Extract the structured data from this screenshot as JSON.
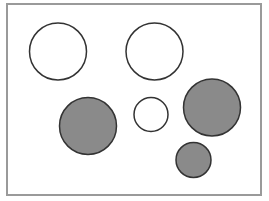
{
  "diagram": {
    "frame": {
      "x": 6,
      "y": 3,
      "width": 256,
      "height": 193,
      "border_color": "#9a9a9a"
    },
    "stroke_color": "#333333",
    "fill_colors": {
      "white": "#ffffff",
      "gray": "#8a8a8a"
    },
    "circles": [
      {
        "id": "circle-1",
        "cx": 58,
        "cy": 51.5,
        "r": 28.5,
        "fill": "white"
      },
      {
        "id": "circle-2",
        "cx": 154.5,
        "cy": 51.5,
        "r": 28.5,
        "fill": "white"
      },
      {
        "id": "circle-3",
        "cx": 88,
        "cy": 126,
        "r": 28.5,
        "fill": "gray"
      },
      {
        "id": "circle-4",
        "cx": 151,
        "cy": 114.5,
        "r": 17,
        "fill": "white"
      },
      {
        "id": "circle-5",
        "cx": 212,
        "cy": 107.5,
        "r": 28.5,
        "fill": "gray"
      },
      {
        "id": "circle-6",
        "cx": 193.5,
        "cy": 160,
        "r": 17.5,
        "fill": "gray"
      }
    ]
  }
}
